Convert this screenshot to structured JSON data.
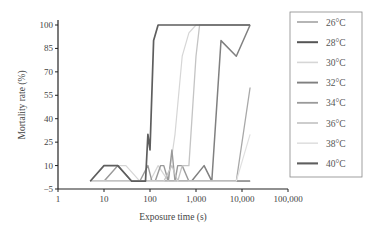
{
  "chart_data": {
    "type": "line",
    "title": "",
    "xlabel": "Exposure time (s)",
    "ylabel": "Mortality rate (%)",
    "xscale": "log",
    "xlim": [
      1,
      100000
    ],
    "ylim": [
      -5,
      100
    ],
    "x_ticks": [
      "1",
      "10",
      "100",
      "1,000",
      "10,000",
      "100,000"
    ],
    "x_tick_values": [
      1,
      10,
      100,
      1000,
      10000,
      100000
    ],
    "y_ticks": [
      "100",
      "85",
      "70",
      "55",
      "40",
      "25",
      "10",
      "−5"
    ],
    "y_tick_values": [
      100,
      85,
      70,
      55,
      40,
      25,
      10,
      -5
    ],
    "grid": false,
    "legend_position": "right",
    "series": [
      {
        "name": "26°C",
        "color": "#a8a8a8",
        "width": 1.3,
        "x": [
          5,
          10,
          30,
          100,
          300,
          1000,
          3000,
          7500,
          15000
        ],
        "y": [
          0,
          0,
          0,
          0,
          0,
          0,
          0,
          0,
          60
        ]
      },
      {
        "name": "28°C",
        "color": "#555555",
        "width": 1.6,
        "x": [
          5,
          10,
          20,
          30,
          60,
          100,
          300,
          1000,
          3000,
          7500,
          15000
        ],
        "y": [
          0,
          0,
          0,
          0,
          0,
          0,
          0,
          0,
          0,
          0,
          0
        ]
      },
      {
        "name": "30°C",
        "color": "#d6d6d6",
        "width": 1.2,
        "x": [
          5,
          10,
          20,
          30,
          60,
          100,
          150,
          250,
          350,
          500,
          700,
          1000,
          15000
        ],
        "y": [
          0,
          0,
          10,
          10,
          0,
          0,
          10,
          0,
          30,
          80,
          95,
          100,
          100
        ]
      },
      {
        "name": "32°C",
        "color": "#808080",
        "width": 1.5,
        "x": [
          5,
          10,
          30,
          100,
          300,
          500,
          800,
          1500,
          2200,
          3500,
          7500,
          15000
        ],
        "y": [
          0,
          0,
          0,
          0,
          0,
          0,
          0,
          10,
          0,
          90,
          80,
          100
        ]
      },
      {
        "name": "34°C",
        "color": "#9a9a9a",
        "width": 1.4,
        "x": [
          5,
          10,
          20,
          40,
          60,
          90,
          110,
          130,
          170,
          200,
          250,
          300,
          350,
          400,
          500,
          700,
          1000,
          15000
        ],
        "y": [
          0,
          0,
          10,
          0,
          0,
          10,
          0,
          0,
          10,
          10,
          0,
          20,
          0,
          10,
          10,
          0,
          0,
          0
        ]
      },
      {
        "name": "36°C",
        "color": "#c4c4c4",
        "width": 1.3,
        "x": [
          5,
          10,
          30,
          100,
          200,
          300,
          400,
          500,
          700,
          1000,
          1200,
          15000
        ],
        "y": [
          0,
          0,
          0,
          0,
          0,
          10,
          0,
          10,
          10,
          80,
          100,
          100
        ]
      },
      {
        "name": "38°C",
        "color": "#e0e0e0",
        "width": 1.2,
        "x": [
          5,
          10,
          100,
          1000,
          7500,
          15000
        ],
        "y": [
          0,
          0,
          0,
          0,
          0,
          30
        ]
      },
      {
        "name": "40°C",
        "color": "#5e5e5e",
        "width": 1.7,
        "x": [
          5,
          10,
          20,
          40,
          80,
          90,
          100,
          120,
          150,
          15000
        ],
        "y": [
          0,
          10,
          10,
          0,
          0,
          30,
          20,
          90,
          100,
          100
        ]
      }
    ]
  }
}
